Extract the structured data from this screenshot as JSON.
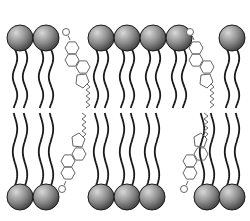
{
  "diagram": {
    "colors": {
      "head_light": "#c8c8c8",
      "head_dark": "#4a4a4a",
      "stroke": "#1a1a1a",
      "cholesterol": "#666666",
      "background": "#ffffff"
    },
    "top_leaflet": {
      "head_y": 38,
      "head_r": 13,
      "heads_x": [
        20,
        46,
        101,
        127,
        153,
        179,
        232
      ]
    },
    "bottom_leaflet": {
      "head_y": 197,
      "head_r": 13,
      "heads_x": [
        20,
        46,
        101,
        127,
        152,
        207,
        232
      ]
    },
    "cholesterols": [
      {
        "x": 72,
        "orientation": "down"
      },
      {
        "x": 196,
        "orientation": "down"
      },
      {
        "x": 68,
        "orientation": "up"
      },
      {
        "x": 190,
        "orientation": "up"
      }
    ]
  }
}
